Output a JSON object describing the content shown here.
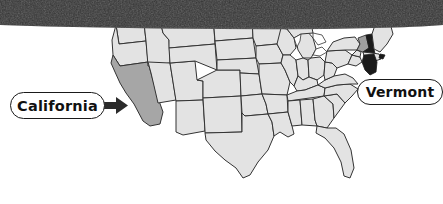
{
  "figure": {
    "type": "map",
    "background_color": "#ffffff",
    "top_band": {
      "name": "dark-textured-band",
      "color": "#333333",
      "height_px": 28
    }
  },
  "map": {
    "name": "usa-states-map",
    "state_fill": "#e3e3e3",
    "state_stroke": "#333333",
    "water_fill": "#ffffff",
    "highlights": [
      {
        "state": "California",
        "fill": "#a6a6a6",
        "label": "California"
      },
      {
        "state": "Vermont",
        "fill": "#9f9f9f",
        "label": "Vermont"
      },
      {
        "state": "New Hampshire",
        "fill": "#1a1a1a",
        "label": ""
      }
    ]
  },
  "callouts": [
    {
      "id": "california",
      "label": "California",
      "text_color": "#111111",
      "box_fill": "#ffffff",
      "box_stroke": "#1a1a1a",
      "arrow": {
        "name": "arrow-right-icon",
        "color": "#2b2b2b",
        "direction": "right"
      }
    },
    {
      "id": "vermont",
      "label": "Vermont",
      "text_color": "#111111",
      "box_fill": "#ffffff",
      "box_stroke": "#1a1a1a",
      "arrow": null
    }
  ]
}
